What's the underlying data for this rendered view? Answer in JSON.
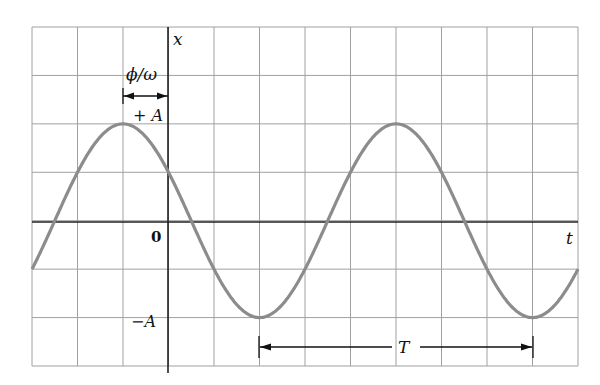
{
  "diagram": {
    "labels": {
      "x_axis": "t",
      "y_axis": "x",
      "origin": "0",
      "plus_amplitude": "+ A",
      "minus_amplitude": "−A",
      "phase_offset": "ϕ/ω",
      "period": "T"
    },
    "grid": {
      "columns": 12,
      "rows": 7,
      "origin_column": 3,
      "origin_row": 4
    },
    "colors": {
      "curve": "#8c8c8c",
      "grid": "#9a9a9a",
      "axis": "#222222",
      "text": "#111111"
    }
  },
  "chart_data": {
    "type": "line",
    "title": "",
    "xlabel": "t",
    "ylabel": "x",
    "function": "x = A cos(ωt + ϕ)",
    "amplitude_grid_units": 2,
    "period_grid_units": 6,
    "phase_shift_grid_units": 1,
    "xlim": [
      -3,
      9
    ],
    "ylim": [
      -3,
      4
    ],
    "grid": true,
    "key_points": [
      {
        "t": -3,
        "x": -1
      },
      {
        "t": -1,
        "x": 2,
        "label": "+A"
      },
      {
        "t": 0,
        "x": 1
      },
      {
        "t": 2,
        "x": -2,
        "label": "-A"
      },
      {
        "t": 5,
        "x": 2
      },
      {
        "t": 8,
        "x": -2
      },
      {
        "t": 9,
        "x": -1
      }
    ],
    "annotations": [
      {
        "text": "ϕ/ω",
        "from_t": -1,
        "to_t": 0
      },
      {
        "text": "T",
        "from_t": 2,
        "to_t": 8
      }
    ]
  }
}
